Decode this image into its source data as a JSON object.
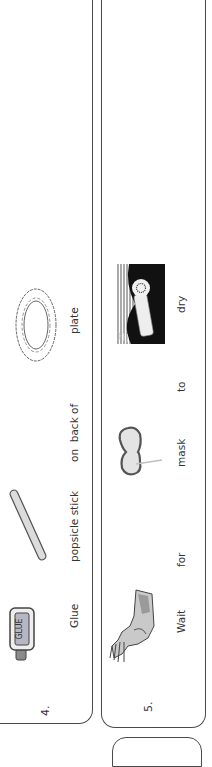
{
  "orientation": "rotated 90deg counter-clockwise",
  "steps": [
    {
      "number": "4.",
      "words": [
        "Glue",
        "popsicle stick",
        "on  back of",
        "plate"
      ],
      "pictures": [
        "glue-bottle",
        "popsicle-stick",
        "paper-plate"
      ]
    },
    {
      "number": "5.",
      "words": [
        "Wait",
        "for",
        "mask",
        "to",
        "dry"
      ],
      "pictures": [
        "hand-wait",
        "mask-on-stick",
        "hair-dryer"
      ]
    }
  ],
  "glue_label": "GLUE"
}
